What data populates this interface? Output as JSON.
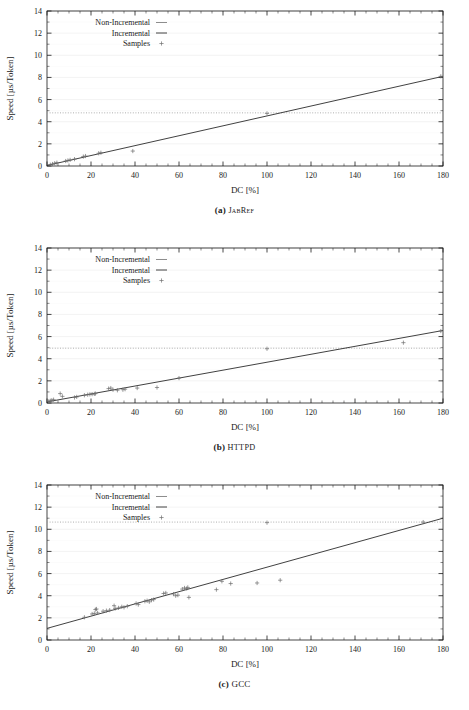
{
  "figure": {
    "panels": [
      {
        "id": "a",
        "caption_label": "(a)",
        "caption_name": "JabRef",
        "caption_style": "small-caps",
        "chart_data": {
          "type": "scatter",
          "title": "",
          "xlabel": "DC [%]",
          "ylabel": "Speed [µs/Token]",
          "xlim": [
            0,
            180
          ],
          "ylim": [
            0,
            14
          ],
          "xticks": [
            0,
            20,
            40,
            60,
            80,
            100,
            120,
            140,
            160,
            180
          ],
          "yticks": [
            0,
            2,
            4,
            6,
            8,
            10,
            12,
            14
          ],
          "xminor_step": 5,
          "yminor_step": 1,
          "grid": true,
          "grid_color": "#ebebeb",
          "legend_position": "top-left",
          "legend": [
            {
              "name": "Non-Incremental",
              "marker": "line",
              "color": "#808080"
            },
            {
              "name": "Incremental",
              "marker": "line",
              "color": "#303030"
            },
            {
              "name": "Samples",
              "marker": "plus",
              "color": "#707070"
            }
          ],
          "series": [
            {
              "name": "Non-Incremental",
              "type": "hline",
              "y": 4.8,
              "color": "#9a9a9a",
              "dash": "1,1.6"
            },
            {
              "name": "Incremental",
              "type": "line",
              "color": "#2b2b2b",
              "x": [
                0,
                180
              ],
              "values": [
                0.05,
                8.1
              ]
            },
            {
              "name": "Samples",
              "type": "scatter",
              "marker": "plus",
              "color": "#6f6f6f",
              "points": [
                [
                  1.5,
                  0.12
                ],
                [
                  2.5,
                  0.18
                ],
                [
                  3.5,
                  0.25
                ],
                [
                  4.5,
                  0.3
                ],
                [
                  8.5,
                  0.45
                ],
                [
                  9.5,
                  0.5
                ],
                [
                  10.5,
                  0.55
                ],
                [
                  12.5,
                  0.62
                ],
                [
                  16.5,
                  0.85
                ],
                [
                  17.5,
                  0.9
                ],
                [
                  23.5,
                  1.15
                ],
                [
                  24.5,
                  1.2
                ],
                [
                  39.0,
                  1.35
                ],
                [
                  100.0,
                  4.75
                ],
                [
                  179.0,
                  8.1
                ]
              ]
            }
          ]
        }
      },
      {
        "id": "b",
        "caption_label": "(b)",
        "caption_name": "HTTPD",
        "caption_style": "small-caps",
        "chart_data": {
          "type": "scatter",
          "title": "",
          "xlabel": "DC [%]",
          "ylabel": "Speed [µs/Token]",
          "xlim": [
            0,
            180
          ],
          "ylim": [
            0,
            14
          ],
          "xticks": [
            0,
            20,
            40,
            60,
            80,
            100,
            120,
            140,
            160,
            180
          ],
          "yticks": [
            0,
            2,
            4,
            6,
            8,
            10,
            12,
            14
          ],
          "xminor_step": 5,
          "yminor_step": 1,
          "grid": true,
          "grid_color": "#ebebeb",
          "legend_position": "top-left",
          "legend": [
            {
              "name": "Non-Incremental",
              "marker": "line",
              "color": "#808080"
            },
            {
              "name": "Incremental",
              "marker": "line",
              "color": "#303030"
            },
            {
              "name": "Samples",
              "marker": "plus",
              "color": "#707070"
            }
          ],
          "series": [
            {
              "name": "Non-Incremental",
              "type": "hline",
              "y": 4.95,
              "color": "#9a9a9a",
              "dash": "1,1.6"
            },
            {
              "name": "Incremental",
              "type": "line",
              "color": "#2b2b2b",
              "x": [
                0,
                180
              ],
              "values": [
                0.1,
                6.55
              ]
            },
            {
              "name": "Samples",
              "type": "scatter",
              "marker": "plus",
              "color": "#6f6f6f",
              "points": [
                [
                  0.8,
                  0.15
                ],
                [
                  1.5,
                  0.2
                ],
                [
                  2.2,
                  0.25
                ],
                [
                  3.0,
                  0.3
                ],
                [
                  6.0,
                  0.85
                ],
                [
                  7.0,
                  0.6
                ],
                [
                  12.5,
                  0.5
                ],
                [
                  13.5,
                  0.55
                ],
                [
                  17.0,
                  0.7
                ],
                [
                  18.5,
                  0.75
                ],
                [
                  19.5,
                  0.78
                ],
                [
                  20.5,
                  0.8
                ],
                [
                  21.5,
                  0.82
                ],
                [
                  22.0,
                  0.85
                ],
                [
                  28.0,
                  1.3
                ],
                [
                  29.0,
                  1.35
                ],
                [
                  30.0,
                  1.2
                ],
                [
                  32.0,
                  1.15
                ],
                [
                  34.5,
                  1.2
                ],
                [
                  35.5,
                  1.25
                ],
                [
                  41.0,
                  1.35
                ],
                [
                  50.0,
                  1.4
                ],
                [
                  60.0,
                  2.25
                ],
                [
                  100.0,
                  4.9
                ],
                [
                  162.0,
                  5.45
                ],
                [
                  179.0,
                  6.5
                ]
              ]
            }
          ]
        }
      },
      {
        "id": "c",
        "caption_label": "(c)",
        "caption_name": "GCC",
        "caption_style": "normal",
        "chart_data": {
          "type": "scatter",
          "title": "",
          "xlabel": "DC [%]",
          "ylabel": "Speed [µs/Token]",
          "xlim": [
            0,
            180
          ],
          "ylim": [
            0,
            14
          ],
          "xticks": [
            0,
            20,
            40,
            60,
            80,
            100,
            120,
            140,
            160,
            180
          ],
          "yticks": [
            0,
            2,
            4,
            6,
            8,
            10,
            12,
            14
          ],
          "xminor_step": 5,
          "yminor_step": 1,
          "grid": true,
          "grid_color": "#ebebeb",
          "legend_position": "top-left",
          "legend": [
            {
              "name": "Non-Incremental",
              "marker": "line",
              "color": "#808080"
            },
            {
              "name": "Incremental",
              "marker": "line",
              "color": "#303030"
            },
            {
              "name": "Samples",
              "marker": "plus",
              "color": "#707070"
            }
          ],
          "series": [
            {
              "name": "Non-Incremental",
              "type": "hline",
              "y": 10.65,
              "color": "#9a9a9a",
              "dash": "1,1.6"
            },
            {
              "name": "Incremental",
              "type": "line",
              "color": "#2b2b2b",
              "x": [
                0,
                180
              ],
              "values": [
                1.05,
                11.0
              ]
            },
            {
              "name": "Samples",
              "type": "scatter",
              "marker": "plus",
              "color": "#6f6f6f",
              "points": [
                [
                  17.0,
                  2.05
                ],
                [
                  20.5,
                  2.35
                ],
                [
                  21.5,
                  2.4
                ],
                [
                  22.0,
                  2.75
                ],
                [
                  22.5,
                  2.8
                ],
                [
                  23.0,
                  2.45
                ],
                [
                  25.5,
                  2.6
                ],
                [
                  27.0,
                  2.65
                ],
                [
                  28.5,
                  2.7
                ],
                [
                  30.5,
                  3.1
                ],
                [
                  31.0,
                  2.85
                ],
                [
                  32.5,
                  2.9
                ],
                [
                  34.0,
                  3.0
                ],
                [
                  35.0,
                  2.95
                ],
                [
                  36.5,
                  3.05
                ],
                [
                  40.5,
                  3.3
                ],
                [
                  41.5,
                  3.2
                ],
                [
                  44.5,
                  3.5
                ],
                [
                  45.5,
                  3.55
                ],
                [
                  46.5,
                  3.45
                ],
                [
                  47.5,
                  3.6
                ],
                [
                  48.5,
                  3.65
                ],
                [
                  53.0,
                  4.2
                ],
                [
                  54.0,
                  4.25
                ],
                [
                  57.5,
                  4.15
                ],
                [
                  58.5,
                  4.0
                ],
                [
                  59.5,
                  4.05
                ],
                [
                  61.5,
                  4.6
                ],
                [
                  62.5,
                  4.7
                ],
                [
                  63.5,
                  4.65
                ],
                [
                  64.0,
                  4.75
                ],
                [
                  64.5,
                  3.85
                ],
                [
                  77.0,
                  4.55
                ],
                [
                  79.5,
                  5.3
                ],
                [
                  83.5,
                  5.1
                ],
                [
                  95.5,
                  5.15
                ],
                [
                  100.0,
                  10.6
                ],
                [
                  106.0,
                  5.4
                ],
                [
                  171.0,
                  10.65
                ]
              ]
            }
          ]
        }
      }
    ]
  }
}
